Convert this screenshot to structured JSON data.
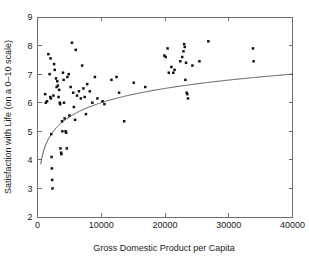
{
  "chart_data": {
    "type": "scatter",
    "title": "",
    "xlabel": "Gross Domestic Product per Capita",
    "ylabel": "Satisfaction with Life (on a 0–10 scale)",
    "xlim": [
      0,
      40000
    ],
    "ylim": [
      2,
      9
    ],
    "xticks": [
      0,
      10000,
      20000,
      30000,
      40000
    ],
    "xtick_labels": [
      "0",
      "10000",
      "20000",
      "30000",
      "40000"
    ],
    "yticks": [
      2,
      3,
      4,
      5,
      6,
      7,
      8,
      9
    ],
    "ytick_labels": [
      "2",
      "3",
      "4",
      "5",
      "6",
      "7",
      "8",
      "9"
    ],
    "grid": false,
    "legend": null,
    "marker": "square-dot",
    "marker_color": "#111111",
    "points": [
      [
        1200,
        6.3
      ],
      [
        1300,
        6.0
      ],
      [
        1500,
        6.05
      ],
      [
        1700,
        7.7
      ],
      [
        1900,
        7.0
      ],
      [
        2000,
        6.2
      ],
      [
        2050,
        7.55
      ],
      [
        2100,
        6.15
      ],
      [
        2150,
        4.9
      ],
      [
        2200,
        4.1
      ],
      [
        2250,
        3.7
      ],
      [
        2300,
        3.3
      ],
      [
        2350,
        3.0
      ],
      [
        2500,
        6.25
      ],
      [
        2600,
        7.35
      ],
      [
        2700,
        7.15
      ],
      [
        2900,
        6.85
      ],
      [
        3000,
        6.55
      ],
      [
        3100,
        6.75
      ],
      [
        3200,
        6.6
      ],
      [
        3300,
        6.2
      ],
      [
        3400,
        6.45
      ],
      [
        3500,
        6.0
      ],
      [
        3550,
        5.95
      ],
      [
        3600,
        4.4
      ],
      [
        3700,
        4.25
      ],
      [
        3750,
        4.2
      ],
      [
        3850,
        5.35
      ],
      [
        3900,
        5.0
      ],
      [
        4000,
        7.05
      ],
      [
        4100,
        6.8
      ],
      [
        4150,
        6.0
      ],
      [
        4250,
        5.45
      ],
      [
        4400,
        5.0
      ],
      [
        4500,
        4.95
      ],
      [
        4600,
        4.4
      ],
      [
        4700,
        6.9
      ],
      [
        4900,
        7.0
      ],
      [
        5000,
        5.55
      ],
      [
        5200,
        6.55
      ],
      [
        5400,
        8.1
      ],
      [
        5600,
        6.35
      ],
      [
        5700,
        5.85
      ],
      [
        5900,
        5.4
      ],
      [
        6000,
        7.85
      ],
      [
        6200,
        6.25
      ],
      [
        6500,
        6.4
      ],
      [
        6800,
        6.15
      ],
      [
        7000,
        7.3
      ],
      [
        7200,
        6.5
      ],
      [
        7400,
        6.2
      ],
      [
        7600,
        5.6
      ],
      [
        7800,
        6.65
      ],
      [
        8200,
        6.4
      ],
      [
        8600,
        6.0
      ],
      [
        9000,
        6.9
      ],
      [
        9400,
        6.15
      ],
      [
        10200,
        6.05
      ],
      [
        10500,
        5.95
      ],
      [
        11600,
        6.8
      ],
      [
        12400,
        6.9
      ],
      [
        12800,
        6.35
      ],
      [
        13600,
        5.35
      ],
      [
        15100,
        6.7
      ],
      [
        16900,
        6.55
      ],
      [
        19900,
        7.65
      ],
      [
        20100,
        7.6
      ],
      [
        20400,
        7.9
      ],
      [
        20600,
        7.05
      ],
      [
        21000,
        7.25
      ],
      [
        21300,
        7.05
      ],
      [
        21500,
        7.15
      ],
      [
        22400,
        7.45
      ],
      [
        22700,
        7.6
      ],
      [
        22900,
        7.8
      ],
      [
        23000,
        8.05
      ],
      [
        23100,
        7.95
      ],
      [
        23200,
        6.8
      ],
      [
        23300,
        7.4
      ],
      [
        23400,
        6.35
      ],
      [
        23500,
        6.3
      ],
      [
        23600,
        6.15
      ],
      [
        24300,
        7.3
      ],
      [
        25400,
        7.45
      ],
      [
        26800,
        8.15
      ],
      [
        33800,
        7.9
      ],
      [
        33900,
        7.45
      ]
    ],
    "fit_curve": {
      "label": "logarithmic trend",
      "color": "#4a4a4a",
      "x_start": 500,
      "x_end": 40000,
      "a": 0.72,
      "b": -0.63,
      "description": "y = a*ln(x) + b"
    }
  },
  "figure": {
    "width": 309,
    "height": 262,
    "background": "#ffffff",
    "axis_color": "#6e6e6e",
    "text_color": "#1a1a1a"
  }
}
